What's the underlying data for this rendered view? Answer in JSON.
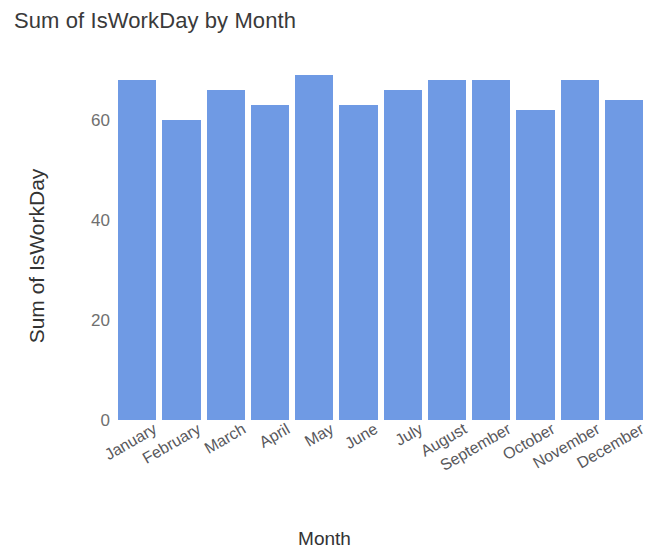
{
  "chart_data": {
    "type": "bar",
    "title": "Sum of IsWorkDay by Month",
    "xlabel": "Month",
    "ylabel": "Sum of IsWorkDay",
    "categories": [
      "January",
      "February",
      "March",
      "April",
      "May",
      "June",
      "July",
      "August",
      "September",
      "October",
      "November",
      "December"
    ],
    "values": [
      68,
      60,
      66,
      63,
      69,
      63,
      66,
      68,
      68,
      62,
      68,
      64
    ],
    "ylim": [
      0,
      72
    ],
    "yticks": [
      0,
      20,
      40,
      60
    ],
    "ytick_labels": [
      "0",
      "20",
      "40",
      "60"
    ],
    "grid": false,
    "legend": false,
    "bar_color": "#6f9ae4",
    "series": [
      {
        "name": "Sum of IsWorkDay",
        "values": [
          68,
          60,
          66,
          63,
          69,
          63,
          66,
          68,
          68,
          62,
          68,
          64
        ]
      }
    ]
  },
  "colors": {
    "bar": "#6f9ae4",
    "title_text": "#3a3a3a",
    "axis_text": "#6f6f6f",
    "background": "#ffffff"
  }
}
